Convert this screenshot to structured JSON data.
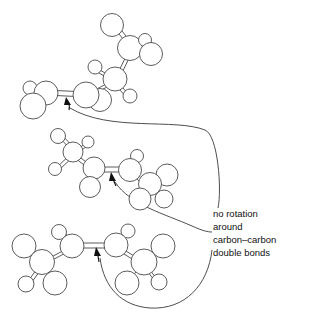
{
  "figure": {
    "background_color": "#ffffff",
    "bond_color": "#4a4a4a",
    "atom_fill": "#ffffff",
    "arrow_color": "#111111",
    "width": 309,
    "height": 318
  },
  "caption": {
    "lines": [
      "no rotation",
      "around",
      "carbon–carbon",
      "double bonds"
    ],
    "line1": "no rotation",
    "line2": "around",
    "line3": "carbon–carbon",
    "line4": "double bonds",
    "x": 213,
    "y": 210
  },
  "molecules": [
    {
      "name": "top-molecule",
      "label": "cis-2-butene ball-and-stick model (upper)",
      "double_bond": "carbon-carbon",
      "atoms": [
        {
          "id": "H1",
          "element": "H",
          "cx": 112,
          "cy": 25,
          "r": 11.5
        },
        {
          "id": "C1",
          "element": "C",
          "cx": 130,
          "cy": 48,
          "r": 12.5
        },
        {
          "id": "H2",
          "element": "H",
          "cx": 145,
          "cy": 40,
          "r": 6.5
        },
        {
          "id": "H3",
          "element": "H",
          "cx": 151,
          "cy": 54,
          "r": 11.5
        },
        {
          "id": "C2",
          "element": "C",
          "cx": 115,
          "cy": 79,
          "r": 12.0
        },
        {
          "id": "H4",
          "element": "H",
          "cx": 95,
          "cy": 67,
          "r": 7.0
        },
        {
          "id": "H5",
          "element": "H",
          "cx": 130,
          "cy": 96,
          "r": 7.0
        },
        {
          "id": "C3",
          "element": "C",
          "cx": 86,
          "cy": 95,
          "r": 13.0
        },
        {
          "id": "H6",
          "element": "H",
          "cx": 100,
          "cy": 100,
          "r": 11.5
        },
        {
          "id": "C4",
          "element": "C",
          "cx": 46,
          "cy": 93,
          "r": 12.0
        },
        {
          "id": "H7",
          "element": "H",
          "cx": 30,
          "cy": 88,
          "r": 7.0
        },
        {
          "id": "H8",
          "element": "H",
          "cx": 33,
          "cy": 106,
          "r": 13.0
        }
      ],
      "bonds": [
        {
          "from": "H1",
          "to": "C1",
          "order": 1
        },
        {
          "from": "C1",
          "to": "H2",
          "order": 1
        },
        {
          "from": "C1",
          "to": "H3",
          "order": 1
        },
        {
          "from": "C1",
          "to": "C2",
          "order": 1
        },
        {
          "from": "C2",
          "to": "H4",
          "order": 1
        },
        {
          "from": "C2",
          "to": "H5",
          "order": 1
        },
        {
          "from": "C2",
          "to": "C3",
          "order": 1
        },
        {
          "from": "C3",
          "to": "H6",
          "order": 1
        },
        {
          "from": "C3",
          "to": "C4",
          "order": 2
        },
        {
          "from": "C4",
          "to": "H7",
          "order": 1
        },
        {
          "from": "C4",
          "to": "H8",
          "order": 1
        }
      ],
      "arrow": {
        "label": "arrow-to-double-bond",
        "tip_x": 66,
        "tip_y": 99
      }
    },
    {
      "name": "middle-molecule",
      "label": "2-butene ball-and-stick model (middle)",
      "double_bond": "carbon-carbon",
      "atoms": [
        {
          "id": "H1",
          "element": "H",
          "cx": 58,
          "cy": 136,
          "r": 7.5
        },
        {
          "id": "C1",
          "element": "C",
          "cx": 73,
          "cy": 152,
          "r": 10.0
        },
        {
          "id": "H2",
          "element": "H",
          "cx": 88,
          "cy": 142,
          "r": 6.0
        },
        {
          "id": "H3",
          "element": "H",
          "cx": 55,
          "cy": 169,
          "r": 6.5
        },
        {
          "id": "C2",
          "element": "C",
          "cx": 94,
          "cy": 168,
          "r": 11.0
        },
        {
          "id": "H4",
          "element": "H",
          "cx": 90,
          "cy": 187,
          "r": 10.5
        },
        {
          "id": "C3",
          "element": "C",
          "cx": 130,
          "cy": 170,
          "r": 11.5
        },
        {
          "id": "H5",
          "element": "H",
          "cx": 137,
          "cy": 156,
          "r": 6.5
        },
        {
          "id": "C4",
          "element": "C",
          "cx": 150,
          "cy": 184,
          "r": 11.5
        },
        {
          "id": "H6",
          "element": "H",
          "cx": 167,
          "cy": 175,
          "r": 11.0
        },
        {
          "id": "H7",
          "element": "H",
          "cx": 140,
          "cy": 199,
          "r": 11.0
        },
        {
          "id": "H8",
          "element": "H",
          "cx": 164,
          "cy": 199,
          "r": 9.0
        }
      ],
      "bonds": [
        {
          "from": "H1",
          "to": "C1",
          "order": 1
        },
        {
          "from": "C1",
          "to": "H2",
          "order": 1
        },
        {
          "from": "C1",
          "to": "H3",
          "order": 1
        },
        {
          "from": "C1",
          "to": "C2",
          "order": 1
        },
        {
          "from": "C2",
          "to": "H4",
          "order": 1
        },
        {
          "from": "C2",
          "to": "C3",
          "order": 2
        },
        {
          "from": "C3",
          "to": "H5",
          "order": 1
        },
        {
          "from": "C3",
          "to": "C4",
          "order": 1
        },
        {
          "from": "C4",
          "to": "H6",
          "order": 1
        },
        {
          "from": "C4",
          "to": "H7",
          "order": 1
        },
        {
          "from": "C4",
          "to": "H8",
          "order": 1
        }
      ],
      "arrow": {
        "label": "arrow-to-double-bond",
        "tip_x": 112,
        "tip_y": 174
      }
    },
    {
      "name": "bottom-molecule",
      "label": "2-butene ball-and-stick model (lower)",
      "double_bond": "carbon-carbon",
      "atoms": [
        {
          "id": "H1",
          "element": "H",
          "cx": 59,
          "cy": 232,
          "r": 7.5
        },
        {
          "id": "C1",
          "element": "C",
          "cx": 72,
          "cy": 246,
          "r": 12.0
        },
        {
          "id": "C2",
          "element": "C",
          "cx": 42,
          "cy": 262,
          "r": 12.5
        },
        {
          "id": "H2",
          "element": "H",
          "cx": 24,
          "cy": 246,
          "r": 12.0
        },
        {
          "id": "H3",
          "element": "H",
          "cx": 26,
          "cy": 284,
          "r": 8.0
        },
        {
          "id": "H4",
          "element": "H",
          "cx": 55,
          "cy": 283,
          "r": 12.0
        },
        {
          "id": "C3",
          "element": "C",
          "cx": 116,
          "cy": 245,
          "r": 12.0
        },
        {
          "id": "H5",
          "element": "H",
          "cx": 128,
          "cy": 231,
          "r": 7.0
        },
        {
          "id": "C4",
          "element": "C",
          "cx": 144,
          "cy": 262,
          "r": 13.0
        },
        {
          "id": "H6",
          "element": "H",
          "cx": 163,
          "cy": 246,
          "r": 12.0
        },
        {
          "id": "H7",
          "element": "H",
          "cx": 127,
          "cy": 283,
          "r": 12.0
        },
        {
          "id": "H8",
          "element": "H",
          "cx": 159,
          "cy": 282,
          "r": 8.0
        }
      ],
      "bonds": [
        {
          "from": "H1",
          "to": "C1",
          "order": 1
        },
        {
          "from": "C1",
          "to": "C2",
          "order": 1
        },
        {
          "from": "C2",
          "to": "H2",
          "order": 1
        },
        {
          "from": "C2",
          "to": "H3",
          "order": 1
        },
        {
          "from": "C2",
          "to": "H4",
          "order": 1
        },
        {
          "from": "C1",
          "to": "C3",
          "order": 2
        },
        {
          "from": "C3",
          "to": "H5",
          "order": 1
        },
        {
          "from": "C3",
          "to": "C4",
          "order": 1
        },
        {
          "from": "C4",
          "to": "H6",
          "order": 1
        },
        {
          "from": "C4",
          "to": "H7",
          "order": 1
        },
        {
          "from": "C4",
          "to": "H8",
          "order": 1
        }
      ],
      "arrow": {
        "label": "arrow-to-double-bond",
        "tip_x": 97,
        "tip_y": 248
      }
    }
  ],
  "leader_lines": [
    {
      "name": "leader-to-top-molecule",
      "path": "M 70 108 C 110 132 175 118 205 130 C 218 135 222 190 218 208"
    },
    {
      "name": "leader-to-middle-molecule",
      "path": "M 115 182 C 130 205 165 214 192 226 C 203 231 208 232 212 232"
    },
    {
      "name": "leader-to-bottom-molecule",
      "path": "M 100 258 C 104 288 122 306 150 308 C 185 310 208 285 212 250"
    }
  ]
}
